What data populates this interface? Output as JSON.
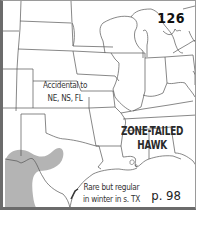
{
  "plate_number": "126",
  "species_name": {
    "line1": "ZONE-TAILED",
    "line2": "HAWK"
  },
  "notes": {
    "accidental": {
      "line1": "Accidental to",
      "line2": "NE, NS, FL"
    },
    "winter": {
      "line1": "Rare but regular",
      "line2": "in winter in s. TX"
    }
  },
  "page_reference": "p. 98",
  "colors": {
    "range_fill": "#b4b4b4",
    "border_lines": "#555555",
    "frame": "#6b6b6b",
    "background": "#ffffff"
  },
  "legend": {
    "range_shading": "gray = range (southwestern US)"
  }
}
